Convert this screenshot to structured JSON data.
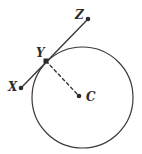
{
  "figure": {
    "kind": "geometry-diagram",
    "width": 142,
    "height": 154,
    "background_color": "#ffffff",
    "stroke_color": "#3a3a3a",
    "label_color": "#2b2b2b",
    "marker_color": "#2b2b2b"
  },
  "circle": {
    "name": "main-circle",
    "center_x": 82.5,
    "center_y": 97.5,
    "radius": 50.5,
    "stroke_width": 1.2
  },
  "points": [
    {
      "id": "X",
      "label": "X",
      "x": 21,
      "y": 88,
      "marker": "dot",
      "label_x": 8,
      "label_y": 91
    },
    {
      "id": "Y",
      "label": "Y",
      "x": 46,
      "y": 61,
      "marker": "square",
      "label_x": 36,
      "label_y": 57
    },
    {
      "id": "Z",
      "label": "Z",
      "x": 88,
      "y": 19,
      "marker": "dot",
      "label_x": 75,
      "label_y": 19
    },
    {
      "id": "C",
      "label": "C",
      "x": 79,
      "y": 96,
      "marker": "dot",
      "label_x": 86,
      "label_y": 101
    }
  ],
  "segments": [
    {
      "id": "tangent-line-XZ",
      "label": "XZ",
      "style": "solid",
      "from": "X",
      "to": "Z",
      "x1": 21,
      "y1": 88,
      "x2": 88,
      "y2": 19,
      "stroke_width": 1.4
    },
    {
      "id": "radius-YC",
      "label": "YC",
      "style": "dashed",
      "from": "Y",
      "to": "C",
      "x1": 46,
      "y1": 61,
      "x2": 79,
      "y2": 96,
      "stroke_width": 1.4,
      "dash_pattern": "3,3"
    }
  ]
}
